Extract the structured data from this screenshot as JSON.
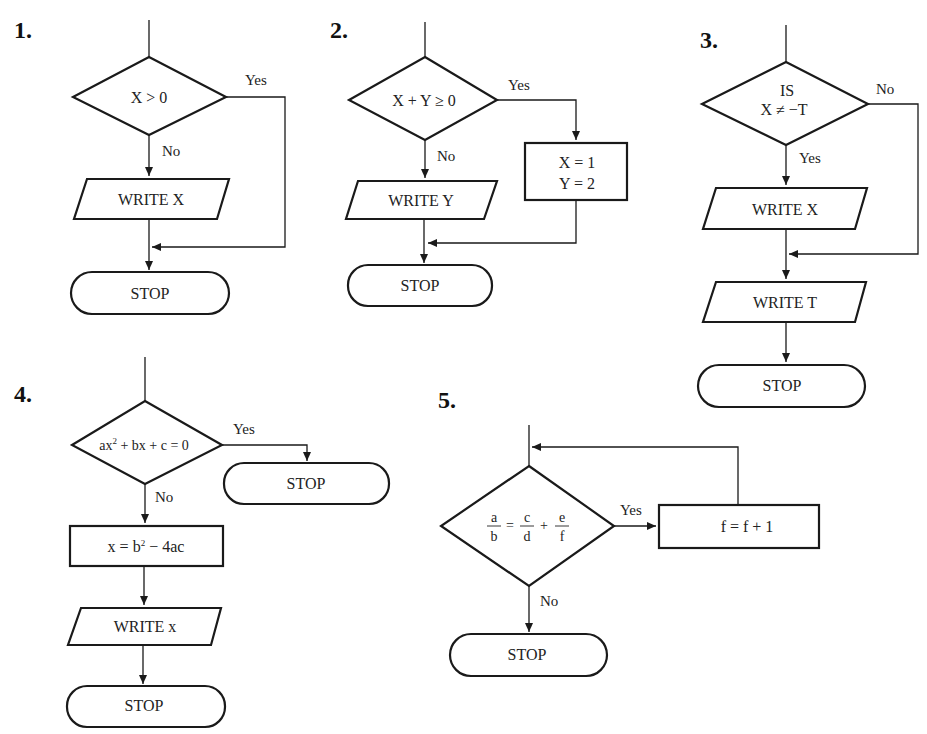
{
  "diagrams": {
    "d1": {
      "number": "1.",
      "decision": "X > 0",
      "yes": "Yes",
      "no": "No",
      "io": "WRITE X",
      "stop": "STOP"
    },
    "d2": {
      "number": "2.",
      "decision": "X + Y ≥ 0",
      "yes": "Yes",
      "no": "No",
      "io": "WRITE Y",
      "process_line1": "X = 1",
      "process_line2": "Y = 2",
      "stop": "STOP"
    },
    "d3": {
      "number": "3.",
      "decision_line1": "IS",
      "decision_line2": "X ≠ −T",
      "yes": "Yes",
      "no": "No",
      "io1": "WRITE X",
      "io2": "WRITE T",
      "stop": "STOP"
    },
    "d4": {
      "number": "4.",
      "decision_a": "ax",
      "decision_sup": "2",
      "decision_b": " + bx + c = 0",
      "yes": "Yes",
      "no": "No",
      "stop_yes": "STOP",
      "process_a": "x = b",
      "process_sup": "2",
      "process_b": " − 4ac",
      "io": "WRITE x",
      "stop": "STOP"
    },
    "d5": {
      "number": "5.",
      "frac1_num": "a",
      "frac1_den": "b",
      "eq": "=",
      "frac2_num": "c",
      "frac2_den": "d",
      "plus": "+",
      "frac3_num": "e",
      "frac3_den": "f",
      "yes": "Yes",
      "no": "No",
      "process": "f = f + 1",
      "stop": "STOP"
    }
  }
}
